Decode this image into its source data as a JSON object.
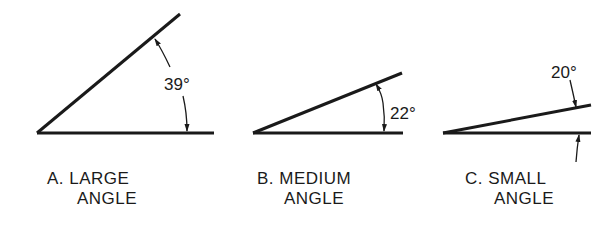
{
  "diagram": {
    "stroke_color": "#1a1a1a",
    "panels": [
      {
        "id": "A",
        "line1": "A. LARGE",
        "line2": "ANGLE",
        "angle_label": "39°"
      },
      {
        "id": "B",
        "line1": "B. MEDIUM",
        "line2": "ANGLE",
        "angle_label": "22°"
      },
      {
        "id": "C",
        "line1": "C. SMALL",
        "line2": "ANGLE",
        "angle_label": "20°"
      }
    ]
  }
}
